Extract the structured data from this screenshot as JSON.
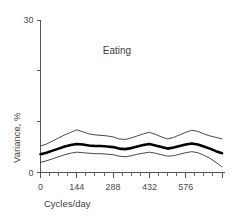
{
  "chart_data": {
    "type": "line",
    "title": "Eating",
    "xlabel": "Cycles/day",
    "ylabel": "Variance, %",
    "xlim": [
      0,
      720
    ],
    "ylim": [
      0,
      30
    ],
    "grid": false,
    "legend": "none",
    "x_ticks": [
      0,
      144,
      288,
      432,
      576
    ],
    "x_tick_labels": [
      "0",
      "144",
      "288",
      "432",
      "576"
    ],
    "x_minor_tick_count_between": 3,
    "y_ticks": [
      0,
      10,
      20,
      30
    ],
    "y_tick_labels": [
      "0",
      "",
      "",
      "30"
    ],
    "x": [
      0,
      24,
      48,
      72,
      96,
      120,
      144,
      168,
      192,
      216,
      240,
      264,
      288,
      312,
      336,
      360,
      384,
      408,
      432,
      456,
      480,
      504,
      528,
      552,
      576,
      600,
      624,
      648,
      672,
      696,
      720
    ],
    "series": [
      {
        "name": "upper-confidence-bound",
        "style": "thin",
        "values": [
          5.2,
          5.6,
          6.2,
          6.8,
          7.4,
          7.9,
          8.4,
          8.0,
          7.6,
          7.4,
          7.3,
          7.2,
          7.0,
          6.6,
          6.5,
          6.8,
          7.2,
          7.6,
          7.9,
          7.5,
          7.0,
          6.6,
          6.9,
          7.4,
          7.9,
          8.3,
          8.1,
          7.6,
          7.2,
          6.9,
          6.6
        ]
      },
      {
        "name": "mean-variance",
        "style": "thick",
        "values": [
          3.6,
          3.9,
          4.3,
          4.7,
          5.1,
          5.4,
          5.6,
          5.5,
          5.3,
          5.2,
          5.2,
          5.1,
          5.0,
          4.7,
          4.6,
          4.8,
          5.1,
          5.4,
          5.6,
          5.3,
          5.0,
          4.7,
          4.9,
          5.2,
          5.5,
          5.7,
          5.5,
          5.1,
          4.7,
          4.2,
          3.8
        ]
      },
      {
        "name": "lower-confidence-bound",
        "style": "thin",
        "values": [
          2.0,
          2.3,
          2.7,
          3.1,
          3.5,
          3.8,
          4.0,
          3.9,
          3.8,
          3.7,
          3.7,
          3.6,
          3.5,
          3.2,
          3.1,
          3.3,
          3.6,
          3.8,
          4.0,
          3.8,
          3.5,
          3.2,
          3.3,
          3.6,
          3.9,
          4.1,
          3.9,
          3.4,
          2.8,
          2.0,
          1.1
        ]
      }
    ]
  },
  "colors": {
    "axis": "#555555",
    "mean_line": "#000000",
    "bound_line": "#333333",
    "text": "#3d3d3d",
    "background": "#ffffff"
  }
}
